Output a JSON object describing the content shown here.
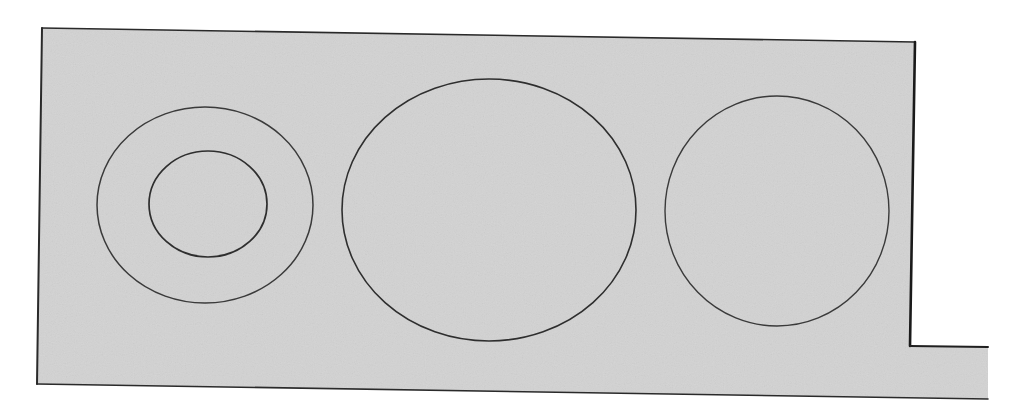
{
  "diagram": {
    "type": "technical-drawing",
    "colors": {
      "background": "#ffffff",
      "plate_fill": "#d3d3d3",
      "outline": "#2a2a2a",
      "hole_stroke": "#3a3a3a"
    },
    "plate": {
      "outline_points": "42,28 915,42 910,346 988,347 988,399 37,384",
      "fill_points": "42,28 915,42 910,346 988,347 988,399 37,384"
    },
    "shapes": [
      {
        "id": "left-outer-ring",
        "cx": 205,
        "cy": 205,
        "rx": 108,
        "ry": 98
      },
      {
        "id": "left-inner-ring",
        "cx": 208,
        "cy": 204,
        "rx": 59,
        "ry": 53
      },
      {
        "id": "center-ellipse",
        "cx": 489,
        "cy": 210,
        "rx": 147,
        "ry": 131
      },
      {
        "id": "right-circle",
        "cx": 777,
        "cy": 211,
        "rx": 112,
        "ry": 115
      }
    ]
  }
}
